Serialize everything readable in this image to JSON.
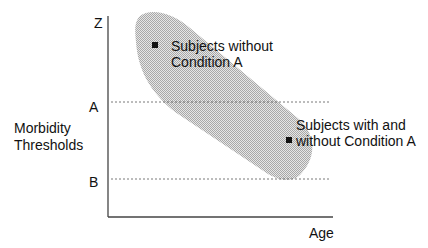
{
  "diagram": {
    "y_axis": {
      "title_line1": "Morbidity",
      "title_line2": "Thresholds",
      "ticks": [
        "Z",
        "A",
        "B"
      ]
    },
    "x_axis": {
      "title": "Age"
    },
    "annotations": [
      {
        "line1": "Subjects without",
        "line2": "Condition A"
      },
      {
        "line1": "Subjects with and",
        "line2": "without Condition A"
      }
    ],
    "colors": {
      "band": "#c8c8c8",
      "line": "#333333"
    }
  }
}
